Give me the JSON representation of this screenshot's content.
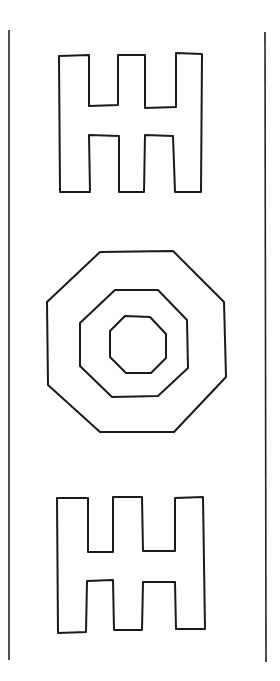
{
  "figure": {
    "stroke_color": "#1a1a1a",
    "background": "#ffffff",
    "borders": {
      "left": {
        "x1": 9,
        "y1": 30,
        "x2": 9,
        "y2": 660
      },
      "right": {
        "x1": 265,
        "y1": 32,
        "x2": 266,
        "y2": 662
      }
    },
    "shapes": [
      {
        "name": "top-comb-shape",
        "points": "59,56 89,55 89,106 118,105 118,55 145,55 145,108 176,107 176,53 202,54 201,192 175,192 173,136 145,135 144,192 119,192 119,136 89,135 90,192 60,192"
      },
      {
        "name": "octagon-outer",
        "points": "100,252 173,251 224,302 226,377 174,432 100,432 48,385 47,302"
      },
      {
        "name": "octagon-middle",
        "points": "115,290 158,290 187,320 188,368 158,396 112,397 80,366 80,323"
      },
      {
        "name": "octagon-inner",
        "points": "125,316 150,317 166,334 166,358 151,373 126,373 110,357 110,331"
      },
      {
        "name": "bottom-comb-shape",
        "points": "57,498 88,498 88,552 113,552 113,497 142,497 143,551 175,551 175,498 203,497 205,629 176,629 175,582 143,582 142,630 114,630 113,580 87,581 86,632 58,633"
      }
    ]
  }
}
